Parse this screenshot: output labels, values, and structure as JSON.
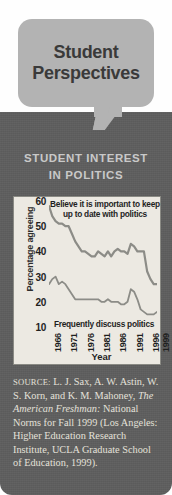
{
  "title": {
    "line1": "Student",
    "line2": "Perspectives"
  },
  "section_heading": {
    "line1": "STUDENT INTEREST",
    "line2": "IN POLITICS"
  },
  "colors": {
    "panel_bg": "#5e5e5e",
    "bubble_bg": "#b3b3b3",
    "chart_bg": "#ece9e2",
    "line": "#8c8c87",
    "heading_text": "#c9c9c9"
  },
  "source": {
    "label": "SOURCE:",
    "text_before": " L. J. Sax, A. W. Astin, W. S. Korn, and K. M. Mahoney, ",
    "italic": "The American Freshman:",
    "text_after": " National Norms for Fall 1999 (Los Angeles: Higher Education Research Institute, UCLA Graduate School of Education, 1999)."
  },
  "chart_data": {
    "type": "line",
    "title": "STUDENT INTEREST IN POLITICS",
    "xlabel": "Year",
    "ylabel": "Percentage agreeing",
    "ylim": [
      10,
      60
    ],
    "yticks": [
      60,
      50,
      40,
      30,
      20,
      10
    ],
    "xticks": [
      "1966",
      "1971",
      "1976",
      "1981",
      "1986",
      "1991",
      "1996",
      "1999"
    ],
    "xlim": [
      1966,
      1999
    ],
    "grid": false,
    "legend": "inline-annotations",
    "annotations": [
      {
        "name": "top-series-label",
        "line1": "Believe it is important to keep",
        "line2": "up to date with politics"
      },
      {
        "name": "bottom-series-label",
        "text": "Frequently discuss politics"
      }
    ],
    "x": [
      1966,
      1967,
      1968,
      1969,
      1970,
      1971,
      1972,
      1973,
      1974,
      1975,
      1976,
      1977,
      1978,
      1979,
      1980,
      1981,
      1982,
      1983,
      1984,
      1985,
      1986,
      1987,
      1988,
      1989,
      1990,
      1991,
      1992,
      1993,
      1994,
      1995,
      1996,
      1997,
      1998,
      1999
    ],
    "series": [
      {
        "name": "Believe it is important to keep up to date with politics",
        "values": [
          58,
          54,
          52,
          51,
          51,
          50,
          50,
          47,
          44,
          42,
          40,
          40,
          39,
          38,
          38,
          40,
          39,
          38,
          40,
          38,
          40,
          41,
          40,
          40,
          39,
          43,
          42,
          40,
          40,
          40,
          32,
          29,
          27,
          27
        ]
      },
      {
        "name": "Frequently discuss politics",
        "values": [
          27,
          29,
          30,
          27,
          28,
          27,
          25,
          23,
          21,
          21,
          21,
          21,
          21,
          21,
          21,
          21,
          20,
          20,
          21,
          20,
          20,
          20,
          19,
          19,
          20,
          25,
          24,
          21,
          17,
          16,
          15,
          15,
          15,
          16
        ]
      }
    ]
  }
}
